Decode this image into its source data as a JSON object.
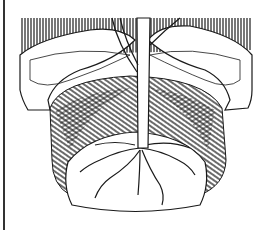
{
  "illustration": {
    "subject": "tree-planting-cross-section",
    "colors": {
      "ink": "#1a1a1a",
      "paper": "#ffffff"
    }
  }
}
